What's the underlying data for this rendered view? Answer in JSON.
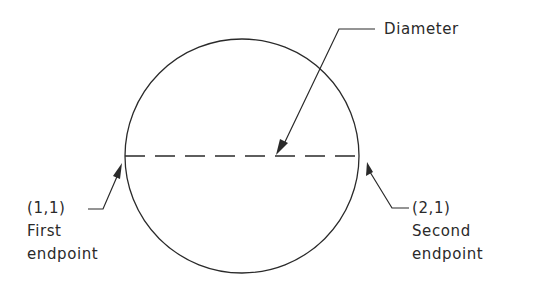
{
  "diagram": {
    "type": "circle-two-point-diameter",
    "circle": {
      "cx": 242,
      "cy": 156,
      "r": 117
    },
    "line_color": "#2a2a2a",
    "background": "#ffffff"
  },
  "labels": {
    "diameter": "Diameter",
    "first_coord": "(1,1)",
    "first_line1": "First",
    "first_line2": "endpoint",
    "second_coord": "(2,1)",
    "second_line1": "Second",
    "second_line2": "endpoint"
  }
}
